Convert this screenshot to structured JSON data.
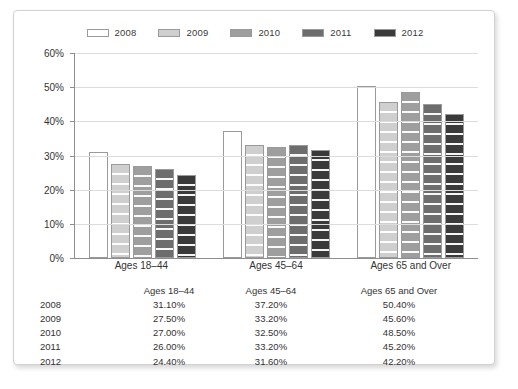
{
  "chart_data": {
    "type": "bar",
    "title": "",
    "xlabel": "",
    "ylabel": "",
    "ylim": [
      0,
      60
    ],
    "ytick_labels": [
      "60%",
      "50%",
      "40%",
      "30%",
      "20%",
      "10%",
      "0%"
    ],
    "ytick_values": [
      60,
      50,
      40,
      30,
      20,
      10,
      0
    ],
    "grid": true,
    "legend_position": "top-center",
    "categories": [
      "Ages 18–44",
      "Ages 45–64",
      "Ages 65 and Over"
    ],
    "series": [
      {
        "name": "2008",
        "values": [
          31.1,
          37.2,
          50.4
        ],
        "color": "#ffffff"
      },
      {
        "name": "2009",
        "values": [
          27.5,
          33.2,
          45.6
        ],
        "color": "#cfcfcf"
      },
      {
        "name": "2010",
        "values": [
          27.0,
          32.5,
          48.5
        ],
        "color": "#9e9e9e"
      },
      {
        "name": "2011",
        "values": [
          26.0,
          33.2,
          45.2
        ],
        "color": "#6d6d6d"
      },
      {
        "name": "2012",
        "values": [
          24.4,
          31.6,
          42.2
        ],
        "color": "#3a3a3a"
      }
    ]
  },
  "legend": {
    "items": [
      {
        "label": "2008"
      },
      {
        "label": "2009"
      },
      {
        "label": "2010"
      },
      {
        "label": "2011"
      },
      {
        "label": "2012"
      }
    ]
  },
  "table": {
    "header": [
      "",
      "Ages 18–44",
      "Ages 45–64",
      "Ages 65 and Over"
    ],
    "rows": [
      {
        "year": "2008",
        "cells": [
          "31.10%",
          "37.20%",
          "50.40%"
        ]
      },
      {
        "year": "2009",
        "cells": [
          "27.50%",
          "33.20%",
          "45.60%"
        ]
      },
      {
        "year": "2010",
        "cells": [
          "27.00%",
          "32.50%",
          "48.50%"
        ]
      },
      {
        "year": "2011",
        "cells": [
          "26.00%",
          "33.20%",
          "45.20%"
        ]
      },
      {
        "year": "2012",
        "cells": [
          "24.40%",
          "31.60%",
          "42.20%"
        ]
      }
    ]
  }
}
